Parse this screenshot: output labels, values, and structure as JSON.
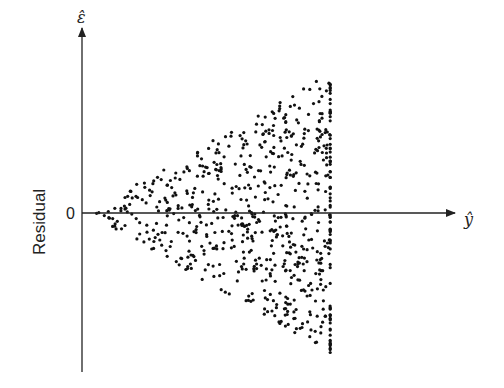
{
  "chart_data": {
    "type": "scatter",
    "title": "",
    "xlabel": "ŷ",
    "ylabel": "Residual",
    "y_axis_symbol": "ε̂",
    "x_axis_symbol": "ŷ",
    "y_zero_tick_label": "0",
    "x_range": [
      0,
      1
    ],
    "y_range": [
      -1,
      1
    ],
    "point_x_range": [
      0.01,
      0.68
    ],
    "envelope": {
      "at_x_min": 0.0,
      "at_x_max": 0.8
    },
    "point_count": 700,
    "grid": false,
    "legend": "none",
    "point_color": "#111111",
    "axis_color": "#222222"
  }
}
